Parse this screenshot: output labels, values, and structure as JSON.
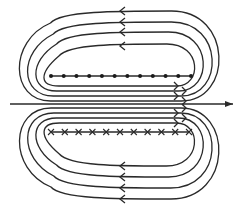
{
  "diagram": {
    "colors": {
      "stroke": "#2a2a2a",
      "background": "#ffffff"
    },
    "axis": {
      "y": 104,
      "x_start": 10,
      "x_end": 233,
      "direction": "right"
    },
    "dots_row": {
      "y": 76,
      "x_start": 51,
      "x_end": 191,
      "count": 12,
      "meaning": "current out of page"
    },
    "crosses_row": {
      "y": 132,
      "x_start": 51,
      "x_end": 189,
      "count": 11,
      "meaning": "current into page"
    },
    "upper_loops": [
      {
        "top_y": 44,
        "bottom_y": 86,
        "left_x": 40,
        "right_x": 200
      },
      {
        "top_y": 32,
        "bottom_y": 91,
        "left_x": 30,
        "right_x": 211
      },
      {
        "top_y": 22,
        "bottom_y": 96,
        "left_x": 20,
        "right_x": 222
      },
      {
        "top_y": 11,
        "bottom_y": 101,
        "left_x": 10,
        "right_x": 231
      }
    ],
    "lower_loops": [
      {
        "top_y": 123,
        "bottom_y": 166,
        "left_x": 40,
        "right_x": 200
      },
      {
        "top_y": 118,
        "bottom_y": 177,
        "left_x": 30,
        "right_x": 211
      },
      {
        "top_y": 113,
        "bottom_y": 188,
        "left_x": 20,
        "right_x": 222
      },
      {
        "top_y": 108,
        "bottom_y": 199,
        "left_x": 10,
        "right_x": 231
      }
    ],
    "loop_arrow_x": 120,
    "loop_arrow_direction": "left",
    "inner_arrow_x": 178,
    "inner_arrow_direction": "right"
  }
}
